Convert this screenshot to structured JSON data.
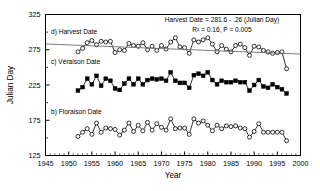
{
  "chart_data": {
    "type": "line",
    "title": "",
    "xlabel": "Year",
    "ylabel": "Julian Day",
    "xlim": [
      1945,
      2000
    ],
    "ylim": [
      125,
      325
    ],
    "xticks": [
      1945,
      1950,
      1955,
      1960,
      1965,
      1970,
      1975,
      1980,
      1985,
      1990,
      1995,
      2000
    ],
    "yticks": [
      125,
      175,
      225,
      275,
      325
    ],
    "minor_xtick_interval": 1,
    "grid": false,
    "legend": "none",
    "annotations": [
      {
        "name": "regression-equation",
        "text": "Harvest Date = 281.6 - .26 (Julian Day)"
      },
      {
        "name": "regression-stats",
        "text": "R² = 0.16,  P = 0.005"
      },
      {
        "name": "panel-label-d",
        "text": "d) Harvest Date"
      },
      {
        "name": "panel-label-c",
        "text": "c) Véraison Date"
      },
      {
        "name": "panel-label-b",
        "text": "b) Floraison Date"
      }
    ],
    "trendline": {
      "name": "harvest-regression-line",
      "x": [
        1945,
        2000
      ],
      "y": [
        283.2,
        268.9
      ]
    },
    "series": [
      {
        "name": "Harvest Date",
        "marker": "open-circle",
        "x": [
          1952,
          1953,
          1954,
          1955,
          1956,
          1957,
          1958,
          1959,
          1960,
          1961,
          1962,
          1963,
          1964,
          1965,
          1966,
          1967,
          1968,
          1969,
          1970,
          1971,
          1972,
          1973,
          1974,
          1975,
          1976,
          1977,
          1978,
          1979,
          1980,
          1981,
          1982,
          1983,
          1984,
          1985,
          1986,
          1987,
          1988,
          1989,
          1990,
          1991,
          1992,
          1993,
          1994,
          1995,
          1996,
          1997
        ],
        "values": [
          272,
          277,
          285,
          288,
          282,
          287,
          286,
          287,
          271,
          275,
          274,
          284,
          281,
          280,
          285,
          275,
          280,
          274,
          281,
          276,
          286,
          292,
          279,
          278,
          270,
          289,
          286,
          289,
          292,
          283,
          272,
          281,
          276,
          272,
          281,
          283,
          278,
          267,
          280,
          279,
          274,
          272,
          270,
          271,
          272,
          248
        ]
      },
      {
        "name": "Véraison Date",
        "marker": "filled-square",
        "x": [
          1952,
          1953,
          1954,
          1955,
          1956,
          1957,
          1958,
          1959,
          1960,
          1961,
          1962,
          1963,
          1964,
          1965,
          1966,
          1967,
          1968,
          1969,
          1970,
          1971,
          1972,
          1973,
          1974,
          1975,
          1976,
          1977,
          1978,
          1979,
          1980,
          1981,
          1982,
          1983,
          1984,
          1985,
          1986,
          1987,
          1988,
          1989,
          1990,
          1991,
          1992,
          1993,
          1994,
          1995,
          1996,
          1997
        ],
        "values": [
          217,
          222,
          234,
          226,
          238,
          224,
          234,
          231,
          220,
          218,
          227,
          234,
          226,
          234,
          226,
          232,
          234,
          233,
          234,
          231,
          243,
          231,
          228,
          228,
          221,
          239,
          241,
          238,
          243,
          232,
          226,
          231,
          229,
          229,
          231,
          229,
          229,
          217,
          225,
          232,
          223,
          221,
          226,
          222,
          219,
          213
        ]
      },
      {
        "name": "Floraison Date",
        "marker": "open-circle",
        "x": [
          1952,
          1953,
          1954,
          1955,
          1956,
          1957,
          1958,
          1959,
          1960,
          1961,
          1962,
          1963,
          1964,
          1965,
          1966,
          1967,
          1968,
          1969,
          1970,
          1971,
          1972,
          1973,
          1974,
          1975,
          1976,
          1977,
          1978,
          1979,
          1980,
          1981,
          1982,
          1983,
          1984,
          1985,
          1986,
          1987,
          1988,
          1989,
          1990,
          1991,
          1992,
          1993,
          1994,
          1995,
          1996,
          1997
        ],
        "values": [
          152,
          158,
          163,
          155,
          171,
          158,
          164,
          163,
          162,
          154,
          161,
          171,
          159,
          168,
          160,
          172,
          161,
          170,
          165,
          161,
          177,
          163,
          164,
          164,
          155,
          177,
          171,
          174,
          168,
          160,
          168,
          163,
          167,
          166,
          167,
          164,
          163,
          151,
          159,
          170,
          158,
          158,
          158,
          158,
          158,
          146
        ]
      }
    ]
  }
}
